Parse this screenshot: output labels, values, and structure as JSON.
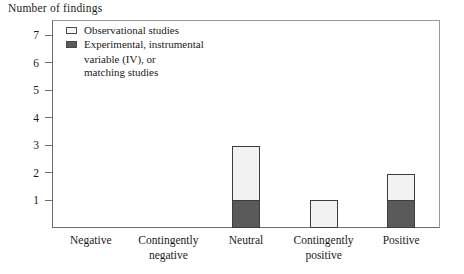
{
  "chart_data": {
    "type": "bar",
    "subtype": "stacked-bar",
    "title": "",
    "ylabel": "Number of findings",
    "xlabel": "",
    "categories": [
      "Negative",
      "Contingently negative",
      "Neutral",
      "Contingently positive",
      "Positive"
    ],
    "category_lines": [
      [
        "Negative"
      ],
      [
        "Contingently",
        "negative"
      ],
      [
        "Neutral"
      ],
      [
        "Contingently",
        "positive"
      ],
      [
        "Positive"
      ]
    ],
    "series": [
      {
        "name": "Experimental, instrumental variable (IV), or matching studies",
        "values": [
          0,
          0,
          1,
          0,
          1
        ],
        "color": "#5a5a5a"
      },
      {
        "name": "Observational studies",
        "values": [
          0,
          0,
          2,
          1,
          1
        ],
        "color": "#f2f2f2"
      }
    ],
    "totals": [
      0,
      0,
      3,
      1,
      2
    ],
    "ylim": [
      0,
      7.55
    ],
    "yticks": [
      1,
      2,
      3,
      4,
      5,
      6,
      7
    ],
    "ytick_labels": [
      "1",
      "2",
      "3",
      "4",
      "5",
      "6",
      "7"
    ],
    "grid": false,
    "legend_position": "top-left",
    "legend": [
      {
        "label": "Observational studies",
        "swatch": "light"
      },
      {
        "label": "Experimental, instrumental",
        "swatch": "dark"
      },
      {
        "label": "variable (IV), or",
        "swatch": "none"
      },
      {
        "label": "matching studies",
        "swatch": "none"
      }
    ]
  }
}
